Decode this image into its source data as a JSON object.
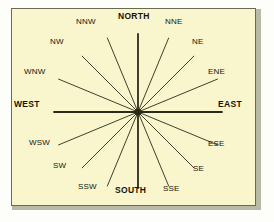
{
  "figure": {
    "kind": "compass-rose-diagram",
    "background_color": "#f9f6cd",
    "border_color": "#6a6a52",
    "line_color": "#2b2b1a",
    "text_color": "#14140a",
    "center": {
      "x": 127,
      "y": 104
    }
  },
  "chart_data": {
    "type": "scatter",
    "title": "",
    "xlabel": "",
    "ylabel": "",
    "categories": [
      "NORTH",
      "NNE",
      "NE",
      "ENE",
      "EAST",
      "ESE",
      "SE",
      "SSE",
      "SOUTH",
      "SSW",
      "SW",
      "WSW",
      "WEST",
      "WNW",
      "NW",
      "NNW"
    ],
    "values": [
      0,
      22.5,
      45,
      67.5,
      90,
      112.5,
      135,
      157.5,
      180,
      202.5,
      225,
      247.5,
      270,
      292.5,
      315,
      337.5
    ],
    "legend": []
  },
  "points": [
    {
      "name": "north",
      "label": "NORTH",
      "bearing_deg": 0,
      "cardinal": true,
      "label_x": 118,
      "label_y": 12,
      "ray_len": 78,
      "ray_weight": 1.8
    },
    {
      "name": "nne",
      "label": "NNE",
      "bearing_deg": 22.5,
      "cardinal": false,
      "label_x": 165,
      "label_y": 18,
      "ray_len": 80,
      "ray_weight": 0.9
    },
    {
      "name": "ne",
      "label": "NE",
      "bearing_deg": 45,
      "cardinal": false,
      "label_x": 192,
      "label_y": 38,
      "ray_len": 79,
      "ray_weight": 0.9
    },
    {
      "name": "ene",
      "label": "ENE",
      "bearing_deg": 67.5,
      "cardinal": false,
      "label_x": 208,
      "label_y": 68,
      "ray_len": 86,
      "ray_weight": 0.9
    },
    {
      "name": "east",
      "label": "EAST",
      "bearing_deg": 90,
      "cardinal": true,
      "label_x": 218,
      "label_y": 100,
      "ray_len": 84,
      "ray_weight": 1.8
    },
    {
      "name": "ese",
      "label": "ESE",
      "bearing_deg": 112.5,
      "cardinal": false,
      "label_x": 208,
      "label_y": 140,
      "ray_len": 86,
      "ray_weight": 0.9
    },
    {
      "name": "se",
      "label": "SE",
      "bearing_deg": 135,
      "cardinal": false,
      "label_x": 193,
      "label_y": 165,
      "ray_len": 79,
      "ray_weight": 0.9
    },
    {
      "name": "sse",
      "label": "SSE",
      "bearing_deg": 157.5,
      "cardinal": false,
      "label_x": 163,
      "label_y": 185,
      "ray_len": 80,
      "ray_weight": 0.9
    },
    {
      "name": "south",
      "label": "SOUTH",
      "bearing_deg": 180,
      "cardinal": true,
      "label_x": 115,
      "label_y": 186,
      "ray_len": 76,
      "ray_weight": 1.8
    },
    {
      "name": "ssw",
      "label": "SSW",
      "bearing_deg": 202.5,
      "cardinal": false,
      "label_x": 78,
      "label_y": 183,
      "ray_len": 80,
      "ray_weight": 0.9
    },
    {
      "name": "sw",
      "label": "SW",
      "bearing_deg": 225,
      "cardinal": false,
      "label_x": 53,
      "label_y": 162,
      "ray_len": 79,
      "ray_weight": 0.9
    },
    {
      "name": "wsw",
      "label": "WSW",
      "bearing_deg": 247.5,
      "cardinal": false,
      "label_x": 29,
      "label_y": 139,
      "ray_len": 86,
      "ray_weight": 0.9
    },
    {
      "name": "west",
      "label": "WEST",
      "bearing_deg": 270,
      "cardinal": true,
      "label_x": 14,
      "label_y": 100,
      "ray_len": 84,
      "ray_weight": 1.8
    },
    {
      "name": "wnw",
      "label": "WNW",
      "bearing_deg": 292.5,
      "cardinal": false,
      "label_x": 24,
      "label_y": 68,
      "ray_len": 86,
      "ray_weight": 0.9
    },
    {
      "name": "nw",
      "label": "NW",
      "bearing_deg": 315,
      "cardinal": false,
      "label_x": 50,
      "label_y": 38,
      "ray_len": 79,
      "ray_weight": 0.9
    },
    {
      "name": "nnw",
      "label": "NNW",
      "bearing_deg": 337.5,
      "cardinal": false,
      "label_x": 76,
      "label_y": 18,
      "ray_len": 80,
      "ray_weight": 0.9
    }
  ]
}
